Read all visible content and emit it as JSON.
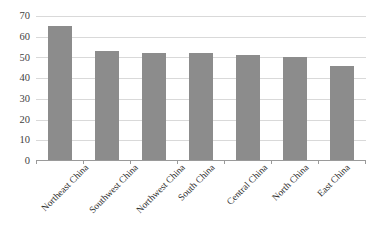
{
  "chart_data": {
    "type": "bar",
    "title": "",
    "xlabel": "",
    "ylabel": "",
    "categories": [
      "Northeast China",
      "Southwest China",
      "Northwest China",
      "South China",
      "Central China",
      "North China",
      "East China"
    ],
    "values": [
      65,
      53,
      52,
      52,
      51,
      50,
      46
    ],
    "ylim": [
      0,
      70
    ],
    "y_ticks": [
      0,
      10,
      20,
      30,
      40,
      50,
      60,
      70
    ],
    "y_tick_labels": [
      "0",
      "10",
      "20",
      "30",
      "40",
      "50",
      "60",
      "70"
    ],
    "grid": true,
    "legend": false,
    "legend_position": "none",
    "bar_color": "#8c8c8c",
    "gridline_color": "#d9d9d9",
    "axis_color": "#9a9a9a",
    "background_color": "#ffffff",
    "label_rotation": -45
  }
}
